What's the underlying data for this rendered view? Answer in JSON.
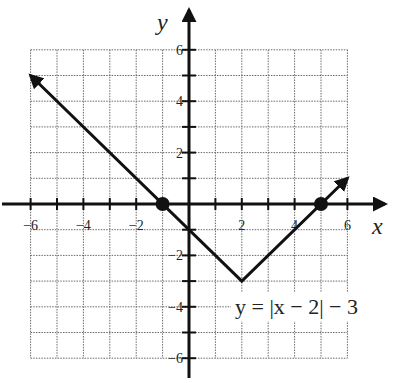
{
  "chart_data": {
    "type": "line",
    "title": "",
    "xlabel": "x",
    "ylabel": "y",
    "xlim": [
      -6,
      6
    ],
    "ylim": [
      -6,
      6
    ],
    "grid": true,
    "x_tick_labels": [
      "-6",
      "-4",
      "-2",
      "2",
      "4",
      "6"
    ],
    "y_tick_labels": [
      "6",
      "4",
      "2",
      "-2",
      "-4",
      "-6"
    ],
    "series": [
      {
        "name": "y = |x - 2| - 3",
        "points": [
          [
            -6,
            5
          ],
          [
            2,
            -3
          ],
          [
            6,
            1
          ]
        ],
        "arrows": "both ends"
      }
    ],
    "marked_points": [
      [
        -1,
        0
      ],
      [
        5,
        0
      ]
    ],
    "annotation": "y = |x − 2| − 3",
    "annotation_position": [
      2.3,
      -4
    ]
  },
  "labels": {
    "x_axis": "x",
    "y_axis": "y",
    "equation": "y = |x − 2| − 3"
  }
}
